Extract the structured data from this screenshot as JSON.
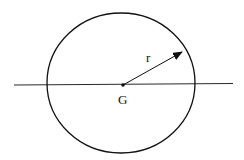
{
  "diagram": {
    "labels": {
      "radius": "r",
      "center": "G"
    },
    "colors": {
      "stroke": "#111111",
      "background": "#ffffff"
    }
  }
}
